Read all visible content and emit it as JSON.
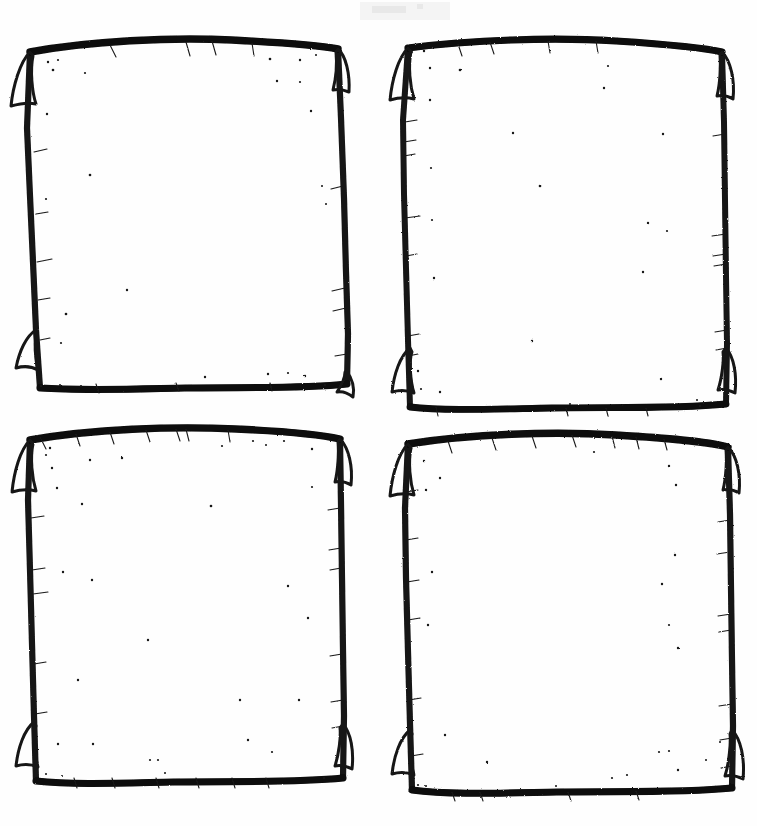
{
  "document": {
    "title": "Hand-drawn Scroll Frames Worksheet",
    "medium": "scanned black ink line art on white paper",
    "canvas": {
      "width": 757,
      "height": 826,
      "background": "#fefefe"
    },
    "ink_color": "#141414",
    "ink_color_light": "#2b2b2b",
    "speckle_color": "#161616",
    "layout": {
      "kind": "grid",
      "rows": 2,
      "columns": 4,
      "panel_count": 4
    }
  },
  "panels": [
    {
      "id": "panel-top-left",
      "name": "Top left scroll frame",
      "position": "top-left",
      "caption": "",
      "box": {
        "x": 20,
        "y": 38,
        "width": 328,
        "height": 354
      },
      "outline": "M 30 52 C 90 41, 170 37, 232 40 C 272 42, 312 44, 338 49 L 341 118 L 344 198 L 346 272 L 348 334 L 347 384 C 300 389, 244 387, 186 388 C 136 389, 84 391, 40 388 L 36 330 L 33 262 L 30 196 L 27 128 Z",
      "outline_inner": "M 36 58 C 96 48, 172 44, 233 47 C 271 49, 309 51, 333 55 L 336 120 L 339 199 L 341 272 L 342 333 L 341 380 C 296 384, 243 382, 186 383 C 137 384, 87 386, 45 383 L 41 330 L 38 262 L 35 197 L 33 131 Z",
      "corner_curls": [
        {
          "corner": "top-left",
          "path": "M 30 52 C 20 62, 13 86, 11 106 C 18 104, 28 102, 36 104 C 32 92, 30 70, 33 56 Z"
        },
        {
          "corner": "top-right",
          "path": "M 338 49 C 346 56, 350 74, 349 92 C 344 90, 338 89, 333 90 C 336 78, 337 62, 336 52 Z"
        },
        {
          "corner": "bottom-left",
          "path": "M 36 330 C 26 336, 19 352, 16 368 C 23 366, 31 366, 38 370 C 35 358, 34 342, 37 334 Z"
        },
        {
          "corner": "bottom-right",
          "path": "M 347 372 C 352 378, 354 388, 353 396 C 348 393, 342 391, 337 392 C 341 386, 345 378, 345 372 Z"
        }
      ],
      "edge_ticks": 19,
      "speckles": 24
    },
    {
      "id": "panel-top-right",
      "name": "Top right scroll frame",
      "position": "top-right",
      "caption": "",
      "box": {
        "x": 398,
        "y": 38,
        "width": 330,
        "height": 374
      },
      "outline": "M 408 48 C 470 40, 552 37, 616 41 C 662 44, 702 47, 722 52 L 724 122 L 725 200 L 726 276 L 727 344 L 726 404 C 676 409, 614 407, 552 408 C 494 409, 444 411, 410 407 L 408 340 L 406 268 L 404 194 L 403 120 Z",
      "outline_inner": "M 414 54 C 476 46, 554 43, 617 47 C 660 50, 697 53, 717 57 L 719 124 L 720 201 L 721 276 L 722 343 L 721 400 C 673 404, 613 402, 552 403 C 495 404, 448 406, 415 402 L 413 340 L 411 268 L 409 195 L 408 123 Z",
      "corner_curls": [
        {
          "corner": "top-left",
          "path": "M 408 48 C 398 58, 392 80, 390 100 C 397 98, 406 97, 414 99 C 410 86, 408 66, 411 52 Z"
        },
        {
          "corner": "top-right",
          "path": "M 722 52 C 730 60, 734 80, 733 98 C 728 96, 722 95, 717 96 C 720 84, 721 66, 720 55 Z"
        },
        {
          "corner": "bottom-left",
          "path": "M 410 348 C 400 356, 394 374, 392 392 C 399 390, 407 390, 414 393 C 410 380, 409 360, 412 352 Z"
        },
        {
          "corner": "bottom-right",
          "path": "M 726 348 C 733 356, 736 374, 734 392 C 729 390, 723 389, 718 390 C 722 378, 724 360, 723 352 Z"
        }
      ],
      "edge_ticks": 20,
      "speckles": 22
    },
    {
      "id": "panel-bottom-left",
      "name": "Bottom left scroll frame",
      "position": "bottom-left",
      "caption": "",
      "box": {
        "x": 20,
        "y": 428,
        "width": 328,
        "height": 357
      },
      "outline": "M 30 440 C 92 429, 172 426, 236 429 C 280 431, 318 434, 340 439 L 341 504 L 342 578 L 343 650 L 344 716 L 343 778 C 294 783, 234 781, 174 782 C 122 783, 74 785, 36 781 L 34 716 L 32 644 L 30 570 L 28 500 Z",
      "outline_inner": "M 36 446 C 98 436, 174 433, 237 436 C 278 438, 314 441, 335 445 L 336 506 L 337 579 L 338 650 L 339 715 L 338 774 C 291 778, 234 776, 175 777 C 124 778, 78 780, 41 776 L 39 716 L 37 645 L 35 571 L 34 503 Z",
      "corner_curls": [
        {
          "corner": "top-left",
          "path": "M 30 440 C 20 450, 14 472, 12 492 C 19 490, 28 489, 36 491 C 32 478, 30 458, 33 444 Z"
        },
        {
          "corner": "top-right",
          "path": "M 340 439 C 348 447, 352 466, 351 484 C 346 482, 340 481, 335 482 C 338 470, 339 452, 338 442 Z"
        },
        {
          "corner": "bottom-left",
          "path": "M 34 722 C 24 730, 18 748, 16 766 C 23 764, 31 764, 38 767 C 34 754, 33 734, 36 726 Z"
        },
        {
          "corner": "bottom-right",
          "path": "M 343 724 C 350 732, 353 750, 351 768 C 346 766, 340 765, 335 766 C 339 754, 341 736, 340 728 Z"
        }
      ],
      "edge_ticks": 24,
      "speckles": 26
    },
    {
      "id": "panel-bottom-right",
      "name": "Bottom right scroll frame",
      "position": "bottom-right",
      "caption": "",
      "box": {
        "x": 398,
        "y": 432,
        "width": 337,
        "height": 363
      },
      "outline": "M 408 444 C 470 434, 552 431, 616 435 C 664 438, 706 441, 728 447 L 730 514 L 731 588 L 732 660 L 733 726 L 732 788 C 682 793, 620 791, 558 792 C 500 793, 448 795, 412 790 L 410 724 L 408 652 L 406 578 L 405 508 Z",
      "outline_inner": "M 414 450 C 476 440, 554 437, 617 441 C 662 444, 701 447, 723 453 L 725 516 L 726 589 L 727 660 L 728 725 L 727 784 C 679 788, 619 786, 558 787 C 501 788, 452 790, 417 785 L 415 724 L 413 653 L 411 579 L 410 511 Z",
      "corner_curls": [
        {
          "corner": "top-left",
          "path": "M 408 444 C 398 454, 392 476, 390 496 C 397 494, 406 493, 414 495 C 410 482, 408 462, 411 448 Z"
        },
        {
          "corner": "top-right",
          "path": "M 728 447 C 736 455, 740 474, 739 492 C 734 490, 728 489, 723 490 C 726 478, 727 460, 726 450 Z"
        },
        {
          "corner": "bottom-left",
          "path": "M 410 730 C 400 738, 394 756, 392 774 C 399 772, 407 772, 414 775 C 410 762, 409 742, 412 734 Z"
        },
        {
          "corner": "bottom-right",
          "path": "M 732 730 C 740 738, 744 758, 742 778 C 736 776, 729 775, 724 776 C 728 764, 730 742, 729 734 Z"
        }
      ],
      "edge_ticks": 25,
      "speckles": 28
    }
  ],
  "artifacts": {
    "scan_smudge": {
      "name": "faint scanner smudge",
      "x": 360,
      "y": 2,
      "width": 90,
      "height": 18,
      "opacity": 0.05
    }
  }
}
